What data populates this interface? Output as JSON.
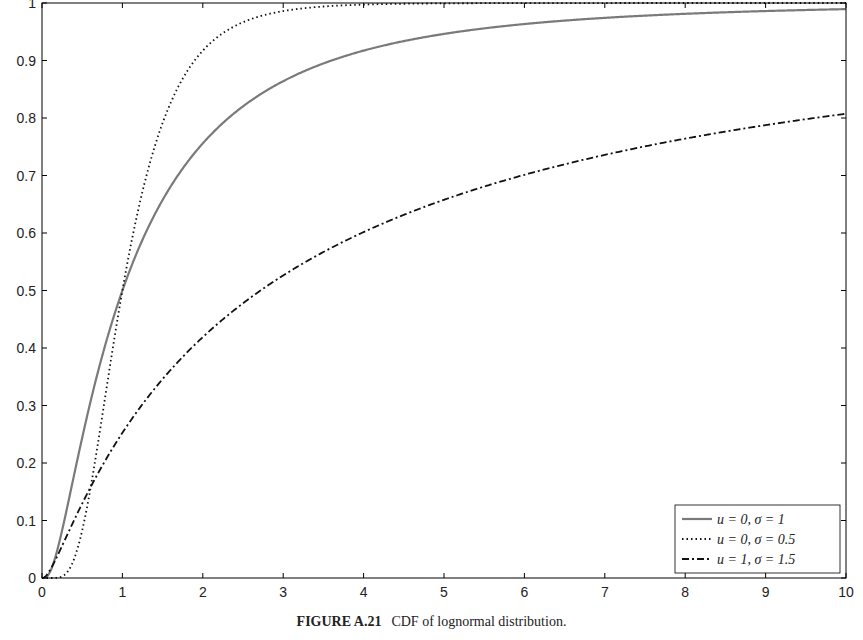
{
  "caption": {
    "label": "FIGURE A.21",
    "text": "CDF of lognormal distribution."
  },
  "colors": {
    "solid": "#7a7a7a",
    "dotted": "#111111",
    "dashdot": "#111111",
    "axis": "#000000"
  },
  "chart_data": {
    "type": "line",
    "title": "",
    "xlabel": "",
    "ylabel": "",
    "xlim": [
      0,
      10
    ],
    "ylim": [
      0,
      1
    ],
    "grid": false,
    "legend_position": "lower right",
    "x_ticks": [
      0,
      1,
      2,
      3,
      4,
      5,
      6,
      7,
      8,
      9,
      10
    ],
    "y_ticks": [
      0,
      0.1,
      0.2,
      0.3,
      0.4,
      0.5,
      0.6,
      0.7,
      0.8,
      0.9,
      1
    ],
    "y_tick_labels": [
      "0",
      "0.1",
      "0.2",
      "0.3",
      "0.4",
      "0.5",
      "0.6",
      "0.7",
      "0.8",
      "0.9",
      "1"
    ],
    "x": [
      0.05,
      0.1,
      0.2,
      0.3,
      0.4,
      0.5,
      0.6,
      0.7,
      0.8,
      0.9,
      1,
      1.25,
      1.5,
      1.75,
      2,
      2.5,
      3,
      3.5,
      4,
      5,
      6,
      7,
      8,
      9,
      10
    ],
    "series": [
      {
        "name": "u = 0, σ = 1",
        "legend_label": "u = 0, σ = 1",
        "style": "solid",
        "mu": 0,
        "sigma": 1,
        "values": [
          0.001,
          0.011,
          0.054,
          0.114,
          0.18,
          0.244,
          0.305,
          0.362,
          0.412,
          0.459,
          0.5,
          0.587,
          0.657,
          0.712,
          0.756,
          0.82,
          0.864,
          0.895,
          0.917,
          0.946,
          0.963,
          0.974,
          0.981,
          0.986,
          0.99
        ]
      },
      {
        "name": "u = 0, σ = 0.5",
        "legend_label": "u = 0, σ = 0.5",
        "style": "dotted",
        "mu": 0,
        "sigma": 0.5,
        "values": [
          0.0,
          0.0,
          0.001,
          0.008,
          0.033,
          0.083,
          0.153,
          0.238,
          0.327,
          0.417,
          0.5,
          0.673,
          0.791,
          0.868,
          0.917,
          0.967,
          0.986,
          0.994,
          0.997,
          0.999,
          1.0,
          1.0,
          1.0,
          1.0,
          1.0
        ]
      },
      {
        "name": "u = 1, σ = 1.5",
        "legend_label": "u = 1, σ = 1.5",
        "style": "dashdot",
        "mu": 1,
        "sigma": 1.5,
        "values": [
          0.007,
          0.024,
          0.067,
          0.111,
          0.154,
          0.193,
          0.228,
          0.261,
          0.29,
          0.317,
          0.252,
          0.296,
          0.335,
          0.369,
          0.401,
          0.455,
          0.5,
          0.539,
          0.572,
          0.628,
          0.672,
          0.709,
          0.739,
          0.765,
          0.787
        ]
      }
    ]
  }
}
